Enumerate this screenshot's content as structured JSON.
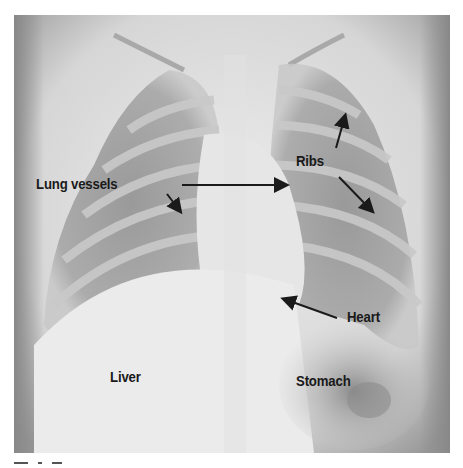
{
  "figure": {
    "labels": {
      "lung_vessels": "Lung vessels",
      "ribs": "Ribs",
      "heart": "Heart",
      "liver": "Liver",
      "stomach": "Stomach"
    },
    "colors": {
      "label_text": "#1a1a1a",
      "arrow": "#1a1a1a",
      "background": "#ffffff"
    }
  }
}
